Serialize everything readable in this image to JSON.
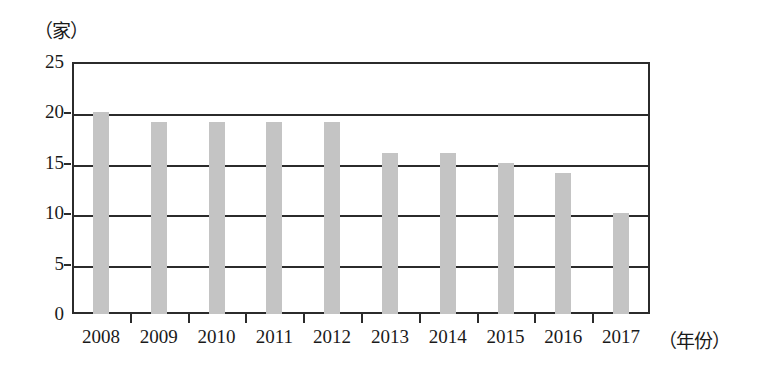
{
  "chart_data": {
    "type": "bar",
    "title": "",
    "subtitle": "",
    "xlabel": "（年份）",
    "ylabel": "（家）",
    "categories": [
      "2008",
      "2009",
      "2010",
      "2011",
      "2012",
      "2013",
      "2014",
      "2015",
      "2016",
      "2017"
    ],
    "values": [
      20,
      19,
      19,
      19,
      19,
      16,
      16,
      15,
      14,
      10
    ],
    "ylim": [
      0,
      25
    ],
    "ytick_labels": [
      "0",
      "5",
      "10",
      "15",
      "20",
      "25"
    ],
    "ytick_values": [
      0,
      5,
      10,
      15,
      20,
      25
    ],
    "grid": "horizontal",
    "legend": "none",
    "bar_color": "#c4c4c4",
    "axis_color": "#2b2b2b",
    "background_color": "#ffffff",
    "annotations": []
  },
  "axes": {
    "y_unit_label": "（家）",
    "x_unit_label": "（年份）"
  }
}
